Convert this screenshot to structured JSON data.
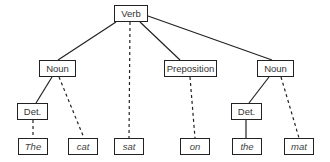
{
  "diagram": {
    "type": "parse-tree",
    "nodes": {
      "verb": {
        "label": "Verb",
        "x": 114,
        "y": 5,
        "w": 34
      },
      "noun_left": {
        "label": "Noun",
        "x": 39,
        "y": 60,
        "w": 37
      },
      "preposition": {
        "label": "Preposition",
        "x": 164,
        "y": 60,
        "w": 53
      },
      "noun_right": {
        "label": "Noun",
        "x": 257,
        "y": 60,
        "w": 37
      },
      "det_left": {
        "label": "Det.",
        "x": 17,
        "y": 103,
        "w": 31
      },
      "det_right": {
        "label": "Det.",
        "x": 231,
        "y": 103,
        "w": 31
      },
      "w_the": {
        "label": "The",
        "x": 18,
        "y": 138,
        "w": 30
      },
      "w_cat": {
        "label": "cat",
        "x": 68,
        "y": 138,
        "w": 30
      },
      "w_sat": {
        "label": "sat",
        "x": 114,
        "y": 138,
        "w": 30
      },
      "w_on": {
        "label": "on",
        "x": 180,
        "y": 138,
        "w": 30
      },
      "w_the2": {
        "label": "the",
        "x": 232,
        "y": 138,
        "w": 30
      },
      "w_mat": {
        "label": "mat",
        "x": 284,
        "y": 138,
        "w": 30
      }
    },
    "edges": [
      {
        "from": "verb",
        "to": "noun_left",
        "style": "solid"
      },
      {
        "from": "verb",
        "to": "w_sat",
        "style": "dashed"
      },
      {
        "from": "verb",
        "to": "preposition",
        "style": "solid"
      },
      {
        "from": "verb",
        "to": "noun_right",
        "style": "solid"
      },
      {
        "from": "noun_left",
        "to": "det_left",
        "style": "solid"
      },
      {
        "from": "noun_left",
        "to": "w_cat",
        "style": "dashed"
      },
      {
        "from": "det_left",
        "to": "w_the",
        "style": "dashed"
      },
      {
        "from": "preposition",
        "to": "w_on",
        "style": "dashed"
      },
      {
        "from": "noun_right",
        "to": "det_right",
        "style": "solid"
      },
      {
        "from": "noun_right",
        "to": "w_mat",
        "style": "dashed"
      },
      {
        "from": "det_right",
        "to": "w_the2",
        "style": "solid"
      }
    ],
    "colors": {
      "line": "#222222",
      "text": "#333333",
      "background": "#ffffff"
    }
  }
}
